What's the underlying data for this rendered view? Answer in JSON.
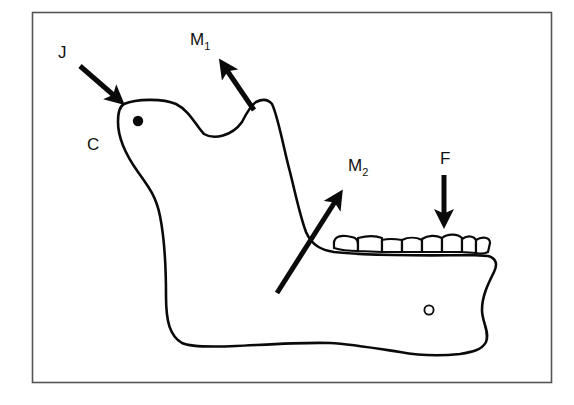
{
  "diagram": {
    "colors": {
      "ink": "#0a0a0a",
      "frame": "#555555",
      "background": "#ffffff"
    },
    "labels": {
      "joint_force": {
        "main": "J",
        "sub": ""
      },
      "condyle": {
        "main": "C",
        "sub": ""
      },
      "muscle_force_1": {
        "main": "M",
        "sub": "1"
      },
      "muscle_force_2": {
        "main": "M",
        "sub": "2"
      },
      "bite_force": {
        "main": "F",
        "sub": ""
      }
    },
    "forces": [
      {
        "id": "J",
        "description": "joint reaction force pointing down-right into condyle"
      },
      {
        "id": "M1",
        "description": "temporalis muscle force pointing up-left from coronoid process"
      },
      {
        "id": "M2",
        "description": "masseter muscle force pointing up-right through ramus"
      },
      {
        "id": "F",
        "description": "bite force pointing down onto teeth"
      }
    ],
    "teeth_count": 8
  }
}
